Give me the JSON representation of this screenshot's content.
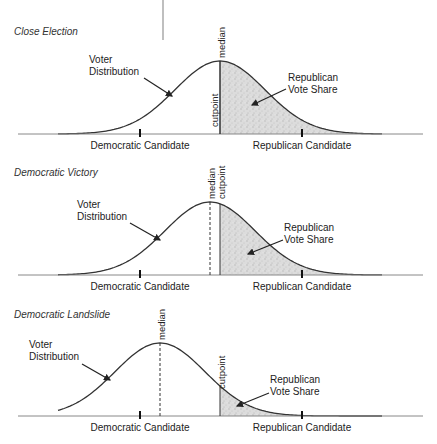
{
  "panels": [
    {
      "title": "Close Election",
      "voter_label_line1": "Voter",
      "voter_label_line2": "Distribution",
      "share_label_line1": "Republican",
      "share_label_line2": "Vote Share",
      "median_label": "median",
      "cutpoint_label": "cutpoint",
      "dem_label": "Democratic Candidate",
      "rep_label": "Republican Candidate"
    },
    {
      "title": "Democratic Victory",
      "voter_label_line1": "Voter",
      "voter_label_line2": "Distribution",
      "share_label_line1": "Republican",
      "share_label_line2": "Vote Share",
      "median_label": "median",
      "cutpoint_label": "cutpoint",
      "dem_label": "Democratic Candidate",
      "rep_label": "Republican Candidate"
    },
    {
      "title": "Democratic Landslide",
      "voter_label_line1": "Voter",
      "voter_label_line2": "Distribution",
      "share_label_line1": "Republican",
      "share_label_line2": "Vote Share",
      "median_label": "median",
      "cutpoint_label": "cutpoint",
      "dem_label": "Democratic Candidate",
      "rep_label": "Republican Candidate"
    }
  ],
  "geometry": {
    "axis_x_start": 18,
    "axis_x_end": 423,
    "dem_tick_x": 140,
    "rep_tick_x": 302,
    "sigma": 45,
    "panels": [
      {
        "baseline_y": 134,
        "peak_height": 73,
        "median_x": 220,
        "cutpoint_x": 220
      },
      {
        "baseline_y": 275,
        "peak_height": 73,
        "median_x": 210,
        "cutpoint_x": 220
      },
      {
        "baseline_y": 416,
        "peak_height": 73,
        "median_x": 160,
        "cutpoint_x": 220
      }
    ]
  },
  "colors": {
    "curve": "#333333",
    "axis": "#888888",
    "shade": "#d8d8d8",
    "text": "#222222"
  }
}
